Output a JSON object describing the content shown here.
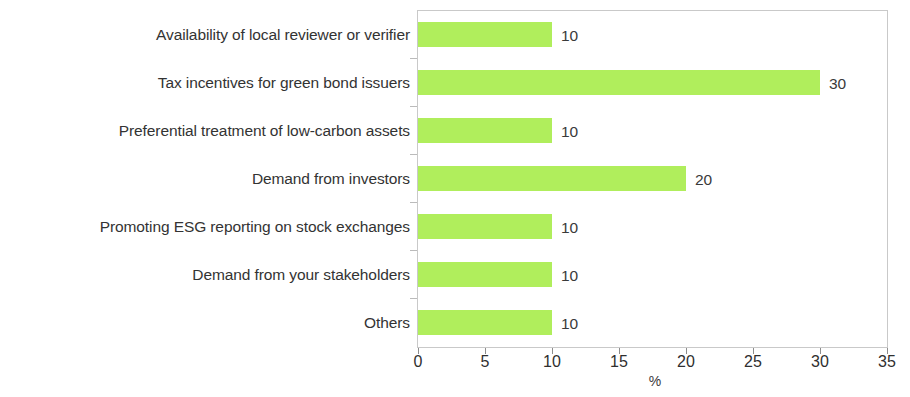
{
  "chart_data": {
    "type": "bar",
    "orientation": "horizontal",
    "title": "",
    "xlabel": "%",
    "ylabel": "",
    "xlim": [
      0,
      35
    ],
    "xticks": [
      0,
      5,
      10,
      15,
      20,
      25,
      30,
      35
    ],
    "xtick_labels": [
      "0",
      "5",
      "10",
      "15",
      "20",
      "25",
      "30",
      "35"
    ],
    "grid": false,
    "legend": false,
    "bar_color": "#b0ee5c",
    "categories": [
      "Availability of local reviewer or verifier",
      "Tax incentives for green bond issuers",
      "Preferential treatment of low-carbon assets",
      "Demand from investors",
      "Promoting ESG reporting on stock exchanges",
      "Demand from your stakeholders",
      "Others"
    ],
    "values": [
      10,
      30,
      10,
      20,
      10,
      10,
      10
    ],
    "value_labels": [
      "10",
      "30",
      "10",
      "20",
      "10",
      "10",
      "10"
    ]
  }
}
